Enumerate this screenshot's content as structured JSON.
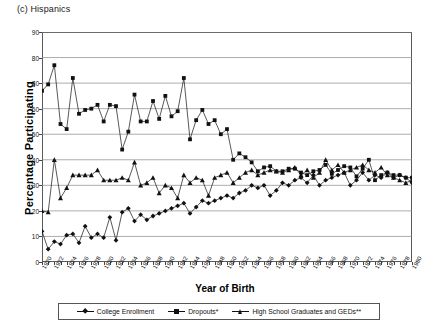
{
  "panel": {
    "title": "(c) Hispanics"
  },
  "axes": {
    "ylabel": "Percentage Participating",
    "xlabel": "Year of Birth"
  },
  "legend": {
    "items": [
      {
        "label": "College Enrollment",
        "marker": "diamond"
      },
      {
        "label": "Dropouts*",
        "marker": "square"
      },
      {
        "label": "High School Graduates and GEDs**",
        "marker": "triangle"
      }
    ]
  },
  "chart_data": {
    "type": "line",
    "title": "(c) Hispanics",
    "xlabel": "Year of Birth",
    "ylabel": "Percentage Participating",
    "ylim": [
      0,
      90
    ],
    "ytick_step": 10,
    "yticks": [
      0,
      10,
      20,
      30,
      40,
      50,
      60,
      70,
      80,
      90
    ],
    "xlim": [
      1920,
      1980
    ],
    "xtick_step": 2,
    "grid": "horizontal",
    "legend_position": "bottom",
    "x": [
      1920,
      1921,
      1922,
      1923,
      1924,
      1925,
      1926,
      1927,
      1928,
      1929,
      1930,
      1931,
      1932,
      1933,
      1934,
      1935,
      1936,
      1937,
      1938,
      1939,
      1940,
      1941,
      1942,
      1943,
      1944,
      1945,
      1946,
      1947,
      1948,
      1949,
      1950,
      1951,
      1952,
      1953,
      1954,
      1955,
      1956,
      1957,
      1958,
      1959,
      1960,
      1961,
      1962,
      1963,
      1964,
      1965,
      1966,
      1967,
      1968,
      1969,
      1970,
      1971,
      1972,
      1973,
      1974,
      1975,
      1976,
      1977,
      1978,
      1979,
      1980
    ],
    "xtick_labels": [
      1920,
      1922,
      1924,
      1926,
      1928,
      1930,
      1932,
      1934,
      1936,
      1938,
      1940,
      1942,
      1944,
      1946,
      1948,
      1950,
      1952,
      1954,
      1956,
      1958,
      1960,
      1962,
      1964,
      1966,
      1968,
      1970,
      1972,
      1974,
      1976,
      1978,
      1980
    ],
    "series": [
      {
        "name": "Dropouts*",
        "marker": "square",
        "values": [
          67,
          69.5,
          77,
          54,
          52,
          72,
          58,
          59.5,
          60,
          61.5,
          55,
          61.5,
          61,
          44,
          51,
          65.5,
          55,
          55,
          63,
          56,
          65,
          57,
          59,
          72,
          48,
          55.5,
          59.5,
          54,
          55.5,
          50,
          52,
          40,
          42.5,
          41,
          39,
          35.5,
          37,
          37.5,
          35.5,
          35.5,
          36.5,
          36.5,
          35,
          34,
          35.5,
          36,
          38,
          34.5,
          36,
          37.5,
          37,
          33.5,
          36.5,
          40,
          32,
          34,
          35,
          34,
          34,
          33,
          33
        ]
      },
      {
        "name": "College Enrollment",
        "marker": "diamond",
        "values": [
          12,
          5,
          8,
          7,
          10.5,
          11,
          7.5,
          14,
          9.5,
          11,
          9.5,
          17.5,
          8.5,
          19.5,
          21,
          16,
          18.5,
          16.5,
          18,
          19,
          20,
          21,
          22,
          23,
          19,
          21.5,
          24,
          23,
          24,
          25,
          26,
          25,
          27,
          28,
          30,
          29,
          30,
          26,
          28,
          31,
          30,
          32,
          33,
          31,
          34,
          30,
          32,
          33,
          34,
          35,
          30,
          32,
          35,
          32,
          34,
          33,
          35,
          33,
          34,
          33,
          31
        ]
      },
      {
        "name": "High School Graduates and GEDs**",
        "marker": "triangle",
        "values": [
          20,
          19.5,
          40,
          25,
          29,
          34,
          34,
          34,
          34,
          36,
          32,
          32,
          32,
          33,
          32,
          39,
          30,
          31,
          33,
          27,
          30,
          29,
          25,
          34,
          31,
          33,
          32,
          26,
          33,
          34,
          35,
          31,
          33,
          35,
          36,
          34,
          35,
          36,
          35.5,
          35,
          36,
          37,
          34,
          36,
          33,
          35,
          40,
          36,
          38,
          35,
          36,
          37,
          38,
          36,
          35,
          37,
          34,
          33,
          32,
          31,
          32
        ]
      }
    ]
  }
}
